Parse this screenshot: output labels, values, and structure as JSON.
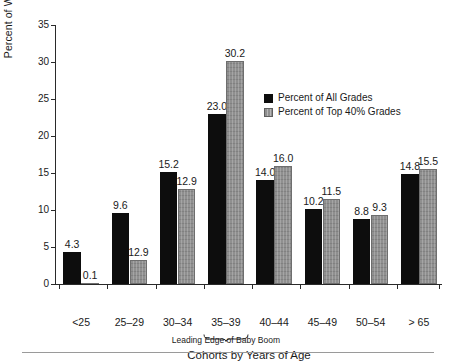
{
  "chart_data": {
    "type": "bar",
    "title": "",
    "xlabel": "Cohorts by Years of Age",
    "ylabel": "Percent of Workforce",
    "ylim": [
      0,
      35
    ],
    "yticks": [
      0,
      5,
      10,
      15,
      20,
      25,
      30,
      35
    ],
    "ytick_labels": [
      "0",
      "5",
      "10",
      "15",
      "20",
      "25",
      "30",
      "35"
    ],
    "grid": false,
    "legend_position": "upper right",
    "categories": [
      "<25",
      "25–29",
      "30–34",
      "35–39",
      "40–44",
      "45–49",
      "50–54",
      "> 65"
    ],
    "series": [
      {
        "name": "Percent of All Grades",
        "color": "#0d0d0d",
        "values": [
          4.3,
          9.6,
          15.2,
          23.0,
          14.0,
          10.2,
          8.8,
          14.8
        ],
        "labels": [
          "4.3",
          "9.6",
          "15.2",
          "23.0",
          "14.0",
          "10.2",
          "8.8",
          "14.8"
        ],
        "drawn_heights": [
          4.3,
          9.6,
          15.2,
          23.0,
          14.0,
          10.2,
          8.8,
          14.8
        ]
      },
      {
        "name": "Percent of Top 40% Grades",
        "color": "#8f8f8f",
        "values": [
          0.1,
          12.9,
          12.9,
          30.2,
          16.0,
          11.5,
          9.3,
          15.5
        ],
        "labels": [
          "0.1",
          "12.9",
          "12.9",
          "30.2",
          "16.0",
          "11.5",
          "9.3",
          "15.5"
        ],
        "drawn_heights": [
          0.1,
          3.2,
          12.9,
          30.2,
          16.0,
          11.5,
          9.3,
          15.5
        ]
      }
    ],
    "annotations": [
      {
        "text": "Leading Edge of Baby Boom",
        "target_category": "35–39",
        "style": "brace-below-tick-label"
      }
    ]
  },
  "legend": {
    "items": [
      {
        "label": "Percent of All Grades",
        "swatch": "black"
      },
      {
        "label": "Percent of Top 40% Grades",
        "swatch": "gray"
      }
    ]
  }
}
